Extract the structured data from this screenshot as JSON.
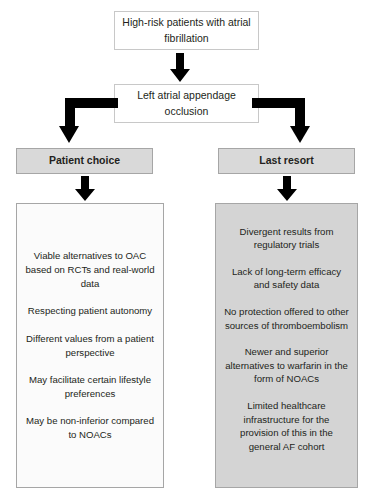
{
  "diagram": {
    "title_box": {
      "text": "High-risk patients with atrial fibrillation"
    },
    "second_box": {
      "text": "Left atrial appendage occlusion"
    },
    "branches": [
      {
        "header": "Patient choice",
        "items": [
          "Viable alternatives to OAC based on RCTs and real-world data",
          "Respecting patient autonomy",
          "Different values from a patient perspective",
          "May facilitate certain lifestyle preferences",
          "May be non-inferior compared to NOACs"
        ]
      },
      {
        "header": "Last resort",
        "items": [
          "Divergent results from regulatory trials",
          "Lack of long-term efficacy and safety data",
          "No protection offered to other sources of thromboembolism",
          "Newer and superior alternatives to warfarin in the form of NOACs",
          "Limited healthcare infrastructure for the provision of this in the general AF cohort"
        ]
      }
    ],
    "colors": {
      "header_fill": "#d9d9d9",
      "right_panel_fill": "#d4d4d4",
      "box_fill": "#ffffff",
      "arrow": "#000000",
      "border": "#a6a6a6",
      "text": "#231f20"
    },
    "connectors": [
      {
        "name": "arrow-top-to-second",
        "type": "down-arrow"
      },
      {
        "name": "elbow-left",
        "type": "elbow-left-down"
      },
      {
        "name": "elbow-right",
        "type": "elbow-right-down"
      },
      {
        "name": "arrow-left-header-to-panel",
        "type": "down-arrow"
      },
      {
        "name": "arrow-right-header-to-panel",
        "type": "down-arrow"
      }
    ]
  }
}
